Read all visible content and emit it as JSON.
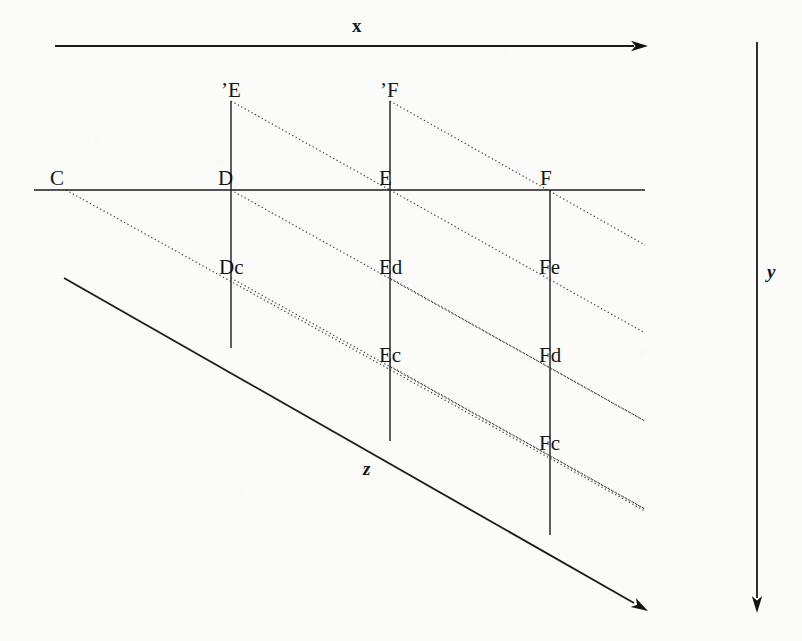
{
  "figure": {
    "background_color": "#fbfbfa",
    "line_color": "#141414",
    "dotted_line_color": "#3a3a3a"
  },
  "axes": [
    {
      "id": "x",
      "label": "x",
      "label_x": 352,
      "label_y": 32,
      "x1": 55,
      "y1": 46,
      "x2": 634,
      "y2": 46,
      "tip_x": 648,
      "tip_y": 46,
      "style": "solid-arrow"
    },
    {
      "id": "y",
      "label": "y",
      "label_x": 767,
      "label_y": 278,
      "x1": 757,
      "y1": 42,
      "x2": 757,
      "y2": 598,
      "tip_x": 757,
      "tip_y": 613,
      "style": "solid-arrow"
    },
    {
      "id": "z",
      "label": "z",
      "label_x": 363,
      "label_y": 475,
      "x1": 64,
      "y1": 278,
      "x2": 634,
      "y2": 603,
      "tip_x": 648,
      "tip_y": 611,
      "style": "solid-arrow"
    }
  ],
  "baseline": {
    "name": "horizontal-baseline",
    "x1": 34,
    "y1": 190,
    "x2": 645,
    "y2": 190
  },
  "verticals": [
    {
      "id": "vertical-D",
      "x": 231,
      "y1": 101,
      "y2": 348
    },
    {
      "id": "vertical-E",
      "x": 390,
      "y1": 101,
      "y2": 441
    },
    {
      "id": "vertical-F",
      "x": 550,
      "y1": 190,
      "y2": 535
    }
  ],
  "dotted_lines": [
    {
      "id": "dotted-Eprime-to-E",
      "x1": 231,
      "y1": 101,
      "x2": 390,
      "y2": 190
    },
    {
      "id": "dotted-Fprime-to-F-ext",
      "x1": 390,
      "y1": 101,
      "x2": 645,
      "y2": 245
    },
    {
      "id": "dotted-C-to-Dc-ext",
      "x1": 66,
      "y1": 190,
      "x2": 645,
      "y2": 511
    },
    {
      "id": "dotted-D-to-Ed-ext",
      "x1": 231,
      "y1": 190,
      "x2": 645,
      "y2": 421
    },
    {
      "id": "dotted-E-to-Fe-ext",
      "x1": 390,
      "y1": 190,
      "x2": 645,
      "y2": 333
    },
    {
      "id": "dotted-Dc-to-Ec-ext",
      "x1": 231,
      "y1": 278,
      "x2": 645,
      "y2": 509
    },
    {
      "id": "dotted-Ed-to-Fd-ext",
      "x1": 390,
      "y1": 278,
      "x2": 645,
      "y2": 421
    },
    {
      "id": "dotted-Ec-to-Fc-ext",
      "x1": 390,
      "y1": 366,
      "x2": 645,
      "y2": 509
    }
  ],
  "points": [
    {
      "id": "point-Eprime",
      "label": "’E",
      "px": 231,
      "py": 101,
      "label_x": 221,
      "label_y": 97,
      "anchor": "start"
    },
    {
      "id": "point-Fprime",
      "label": "’F",
      "px": 390,
      "py": 101,
      "label_x": 380,
      "label_y": 97,
      "anchor": "start"
    },
    {
      "id": "point-C",
      "label": "C",
      "px": 66,
      "py": 190,
      "label_x": 50,
      "label_y": 185,
      "anchor": "start"
    },
    {
      "id": "point-D",
      "label": "D",
      "px": 231,
      "py": 190,
      "label_x": 218,
      "label_y": 185,
      "anchor": "start"
    },
    {
      "id": "point-E",
      "label": "E",
      "px": 390,
      "py": 190,
      "label_x": 379,
      "label_y": 185,
      "anchor": "start"
    },
    {
      "id": "point-F",
      "label": "F",
      "px": 550,
      "py": 190,
      "label_x": 540,
      "label_y": 185,
      "anchor": "start"
    },
    {
      "id": "point-Dc",
      "label": "Dc",
      "px": 231,
      "py": 278,
      "label_x": 219,
      "label_y": 274,
      "anchor": "start"
    },
    {
      "id": "point-Ed",
      "label": "Ed",
      "px": 390,
      "py": 278,
      "label_x": 379,
      "label_y": 274,
      "anchor": "start"
    },
    {
      "id": "point-Fe",
      "label": "Fe",
      "px": 550,
      "py": 278,
      "label_x": 539,
      "label_y": 274,
      "anchor": "start"
    },
    {
      "id": "point-Ec",
      "label": "Ec",
      "px": 390,
      "py": 366,
      "label_x": 379,
      "label_y": 362,
      "anchor": "start"
    },
    {
      "id": "point-Fd",
      "label": "Fd",
      "px": 550,
      "py": 366,
      "label_x": 539,
      "label_y": 362,
      "anchor": "start"
    },
    {
      "id": "point-Fc",
      "label": "Fc",
      "px": 550,
      "py": 454,
      "label_x": 539,
      "label_y": 450,
      "anchor": "start"
    }
  ]
}
